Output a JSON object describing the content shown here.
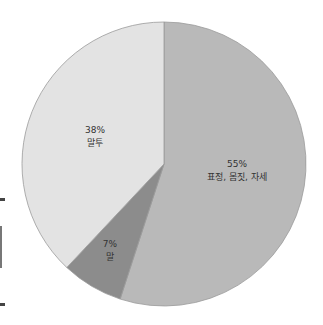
{
  "chart_data": {
    "type": "pie",
    "title": "",
    "slices": [
      {
        "label": "표정, 몸짓, 자세",
        "value": 55,
        "display": "55%",
        "color": "#b9b9b9"
      },
      {
        "label": "말",
        "value": 7,
        "display": "7%",
        "color": "#8c8c8c"
      },
      {
        "label": "말투",
        "value": 38,
        "display": "38%",
        "color": "#e3e3e3"
      }
    ],
    "start_angle": "12 o'clock, clockwise",
    "legend": "none (labels inside slices)"
  },
  "labels": {
    "s55_pct": "55%",
    "s55_name": "표정, 몸짓, 자세",
    "s7_pct": "7%",
    "s7_name": "말",
    "s38_pct": "38%",
    "s38_name": "말투"
  }
}
